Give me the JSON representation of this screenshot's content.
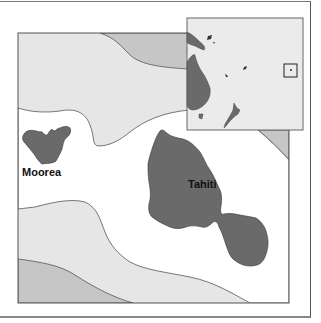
{
  "map": {
    "labels": {
      "moorea": "Moorea",
      "tahiti": "Tahiti"
    },
    "inset": {
      "description": "Locator map of the southwest Pacific showing Australia, New Guinea, New Zealand and island groups, with a box marking Tahiti's location",
      "highlight": "Tahiti location box"
    },
    "colors": {
      "land": "#6a6a6a",
      "shallow_water": "#ffffff",
      "mid_water": "#e6e6e6",
      "deep_water": "#c6c6c6",
      "inset_sea": "#ebebeb",
      "border": "#555555"
    }
  }
}
